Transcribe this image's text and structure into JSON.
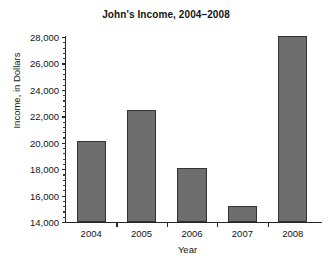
{
  "chart_data": {
    "type": "bar",
    "title": "John's Income, 2004–2008",
    "xlabel": "Year",
    "ylabel": "Income, in Dollars",
    "categories": [
      "2004",
      "2005",
      "2006",
      "2007",
      "2008"
    ],
    "values": [
      20100,
      22500,
      18100,
      15200,
      28050
    ],
    "ylim": [
      14000,
      28000
    ],
    "ytick_values": [
      14000,
      16000,
      18000,
      20000,
      22000,
      24000,
      26000,
      28000
    ],
    "ytick_labels": [
      "14,000",
      "16,000",
      "18,000",
      "20,000",
      "22,000",
      "24,000",
      "26,000",
      "28,000"
    ],
    "minor_tick_step": 400,
    "grid": false,
    "legend": null,
    "bar_color": "#6e6e6e",
    "bar_edge_color": "#333333",
    "axis_color": "#262626",
    "background_color": "#ffffff",
    "series": [
      {
        "name": "Income",
        "points": [
          {
            "category": "2004",
            "value": 20100
          },
          {
            "category": "2005",
            "value": 22500
          },
          {
            "category": "2006",
            "value": 18100
          },
          {
            "category": "2007",
            "value": 15200
          },
          {
            "category": "2008",
            "value": 28050
          }
        ]
      }
    ]
  }
}
